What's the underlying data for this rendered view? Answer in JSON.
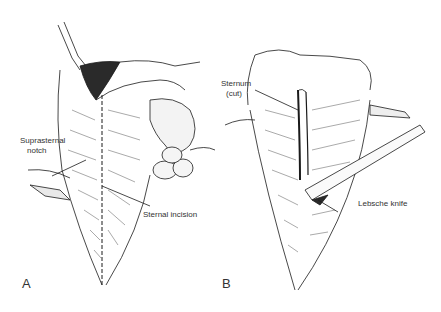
{
  "figure": {
    "panels": [
      {
        "letter": "A",
        "labels": {
          "suprasternal_1": "Suprasternal",
          "suprasternal_2": "notch",
          "sternal_incision": "Sternal incision"
        }
      },
      {
        "letter": "B",
        "labels": {
          "sternum_1": "Sternum",
          "sternum_2": "(cut)",
          "lebsche_knife": "Lebsche knife"
        }
      }
    ],
    "colors": {
      "ink": "#1a1a1a",
      "shade": "#555555",
      "background": "#ffffff"
    }
  }
}
